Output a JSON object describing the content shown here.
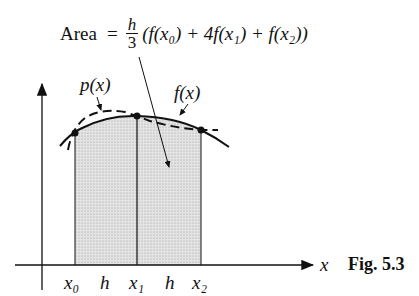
{
  "formula": {
    "lhs": "Area",
    "eq": "=",
    "frac_num": "h",
    "frac_den": "3",
    "rhs": "(f(x₀) + 4f(x₁) + f(x₂))"
  },
  "labels": {
    "p": "p(x)",
    "f": "f(x)",
    "x_axis": "x",
    "ticks": [
      "x₀",
      "h",
      "x₁",
      "h",
      "x₂"
    ]
  },
  "caption": "Fig. 5.3",
  "colors": {
    "ink": "#111111",
    "shade": "#dcdcdc"
  }
}
